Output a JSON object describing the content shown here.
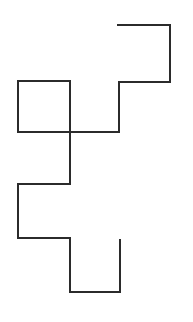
{
  "figure": {
    "canvas": {
      "width": 193,
      "height": 322,
      "background_color": "#ffffff"
    },
    "style": {
      "stroke_color": "#2b2b2b",
      "stroke_width": 2,
      "fill": "none",
      "line_cap": "square",
      "line_join": "miter"
    },
    "shapes": [
      {
        "name": "staircase-polyline",
        "type": "polyline",
        "closed": false,
        "points": [
          [
            118,
            25
          ],
          [
            170,
            25
          ],
          [
            170,
            82
          ],
          [
            119,
            82
          ],
          [
            119,
            132
          ],
          [
            18,
            132
          ],
          [
            18,
            81
          ],
          [
            70,
            81
          ],
          [
            70,
            184
          ],
          [
            18,
            184
          ],
          [
            18,
            238
          ],
          [
            70,
            238
          ],
          [
            70,
            292
          ],
          [
            120,
            292
          ],
          [
            120,
            240
          ]
        ]
      },
      {
        "name": "left-square-outline",
        "type": "polyline",
        "closed": false,
        "points": [
          [
            18,
            132
          ],
          [
            18,
            81
          ],
          [
            70,
            81
          ],
          [
            70,
            132
          ],
          [
            18,
            132
          ]
        ]
      }
    ],
    "segments": [
      {
        "name": "top-horizontal",
        "orientation": "horizontal",
        "from": [
          118,
          25
        ],
        "to": [
          170,
          25
        ],
        "length": 52
      },
      {
        "name": "upper-right-vertical",
        "orientation": "vertical",
        "from": [
          170,
          25
        ],
        "to": [
          170,
          82
        ],
        "length": 57
      },
      {
        "name": "upper-middle-horizontal",
        "orientation": "horizontal",
        "from": [
          170,
          82
        ],
        "to": [
          119,
          82
        ],
        "length": 51
      },
      {
        "name": "center-right-vertical",
        "orientation": "vertical",
        "from": [
          119,
          82
        ],
        "to": [
          119,
          132
        ],
        "length": 50
      },
      {
        "name": "center-horizontal",
        "orientation": "horizontal",
        "from": [
          119,
          132
        ],
        "to": [
          18,
          132
        ],
        "length": 101
      },
      {
        "name": "square-left-vertical",
        "orientation": "vertical",
        "from": [
          18,
          132
        ],
        "to": [
          18,
          81
        ],
        "length": 51
      },
      {
        "name": "square-top-horizontal",
        "orientation": "horizontal",
        "from": [
          18,
          81
        ],
        "to": [
          70,
          81
        ],
        "length": 52
      },
      {
        "name": "long-middle-vertical",
        "orientation": "vertical",
        "from": [
          70,
          81
        ],
        "to": [
          70,
          184
        ],
        "length": 103
      },
      {
        "name": "lower-middle-horizontal",
        "orientation": "horizontal",
        "from": [
          70,
          184
        ],
        "to": [
          18,
          184
        ],
        "length": 52
      },
      {
        "name": "lower-left-vertical",
        "orientation": "vertical",
        "from": [
          18,
          184
        ],
        "to": [
          18,
          238
        ],
        "length": 54
      },
      {
        "name": "lower-horizontal",
        "orientation": "horizontal",
        "from": [
          18,
          238
        ],
        "to": [
          70,
          238
        ],
        "length": 52
      },
      {
        "name": "bottom-left-vertical",
        "orientation": "vertical",
        "from": [
          70,
          238
        ],
        "to": [
          70,
          292
        ],
        "length": 54
      },
      {
        "name": "bottom-horizontal",
        "orientation": "horizontal",
        "from": [
          70,
          292
        ],
        "to": [
          120,
          292
        ],
        "length": 50
      },
      {
        "name": "bottom-right-vertical",
        "orientation": "vertical",
        "from": [
          120,
          292
        ],
        "to": [
          120,
          240
        ],
        "length": 52
      }
    ],
    "endpoints": [
      {
        "name": "start-endpoint",
        "at": [
          118,
          25
        ]
      },
      {
        "name": "end-endpoint",
        "at": [
          120,
          240
        ]
      }
    ],
    "crossings": [
      {
        "name": "crossing-point",
        "at": [
          70,
          132
        ]
      }
    ]
  }
}
